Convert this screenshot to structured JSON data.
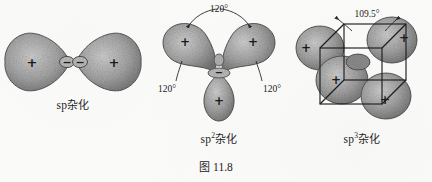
{
  "figure": {
    "caption_cn": "图",
    "caption_number": "11.8",
    "caption_full": "图 11.8",
    "background_color": "#fbfbfa",
    "ink_color": "#2a2a2a",
    "lobe_fill": "#9d9d9d"
  },
  "panels": [
    {
      "id": "sp",
      "label_base": "sp",
      "label_sup": "",
      "label_cn": "杂化",
      "label_full": "sp 杂化",
      "hybridization": "sp",
      "lobe_count": 2,
      "bond_angle": "180°",
      "geometry": "linear",
      "positive_signs": [
        "+",
        "+"
      ],
      "negative_signs": [
        "−",
        "−"
      ],
      "angle_labels": []
    },
    {
      "id": "sp2",
      "label_base": "sp",
      "label_sup": "2",
      "label_cn": "杂化",
      "label_full": "sp2 杂化",
      "hybridization": "sp2",
      "lobe_count": 3,
      "bond_angle": "120°",
      "geometry": "trigonal planar",
      "positive_signs": [
        "+",
        "+",
        "+"
      ],
      "negative_signs": [
        "−"
      ],
      "angle_labels": [
        {
          "name": "angle-top",
          "text": "120°"
        },
        {
          "name": "angle-left",
          "text": "120°"
        },
        {
          "name": "angle-right",
          "text": "120°"
        }
      ]
    },
    {
      "id": "sp3",
      "label_base": "sp",
      "label_sup": "3",
      "label_cn": "杂化",
      "label_full": "sp3 杂化",
      "hybridization": "sp3",
      "lobe_count": 4,
      "bond_angle": "109.5°",
      "geometry": "tetrahedral (inscribed in cube)",
      "positive_signs": [
        "+",
        "+",
        "+",
        "+"
      ],
      "negative_signs": [],
      "angle_labels": [
        {
          "name": "angle-top",
          "text": "109.5°"
        }
      ]
    }
  ]
}
